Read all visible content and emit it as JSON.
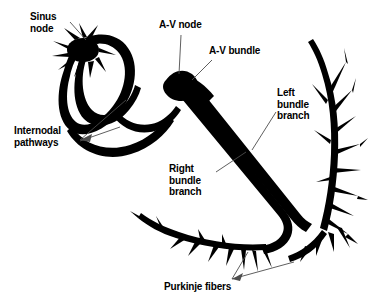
{
  "figure": {
    "background_color": "#ffffff",
    "ink_color": "#000000",
    "leader_line_color": "#4d4d4d",
    "width": 375,
    "height": 304
  },
  "labels": {
    "sinus_node": "Sinus\nnode",
    "av_node": "A-V node",
    "av_bundle": "A-V bundle",
    "internodal_pathways": "Internodal\npathways",
    "left_bundle_branch": "Left\nbundle\nbranch",
    "right_bundle_branch": "Right\nbundle\nbranch",
    "purkinje_fibers": "Purkinje fibers"
  },
  "structures": [
    {
      "name": "sinus-node",
      "description": "Star-burst node at top of atrial loop"
    },
    {
      "name": "internodal-pathways",
      "description": "Oval atrial conduction loop"
    },
    {
      "name": "av-node",
      "description": "Dark node at junction of atria and ventricular bundle"
    },
    {
      "name": "av-bundle",
      "description": "Thick bundle descending to lower right"
    },
    {
      "name": "left-bundle-branch",
      "description": "Branch fanning along right wall"
    },
    {
      "name": "right-bundle-branch",
      "description": "Branch descending to apex"
    },
    {
      "name": "purkinje-fibers",
      "description": "Fine terminal fiber trees at apex and walls"
    }
  ]
}
